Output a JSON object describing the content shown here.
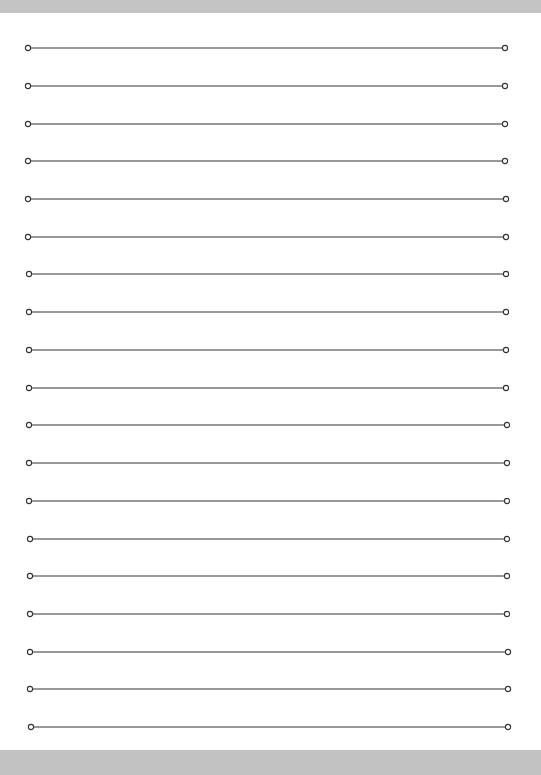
{
  "document": {
    "type": "lined-paper",
    "line_count": 20,
    "line_color": "#333333",
    "background_color": "#ffffff",
    "frame_color": "#c4c4c4",
    "endpoint_marker": "circle-icon",
    "lines": [
      {
        "y": 48,
        "x1": 28,
        "x2": 505
      },
      {
        "y": 86,
        "x1": 28,
        "x2": 505
      },
      {
        "y": 124,
        "x1": 28,
        "x2": 505
      },
      {
        "y": 161,
        "x1": 28,
        "x2": 505
      },
      {
        "y": 199,
        "x1": 28,
        "x2": 506
      },
      {
        "y": 237,
        "x1": 28,
        "x2": 506
      },
      {
        "y": 274,
        "x1": 29,
        "x2": 506
      },
      {
        "y": 312,
        "x1": 29,
        "x2": 506
      },
      {
        "y": 350,
        "x1": 29,
        "x2": 506
      },
      {
        "y": 388,
        "x1": 29,
        "x2": 506
      },
      {
        "y": 425,
        "x1": 29,
        "x2": 507
      },
      {
        "y": 463,
        "x1": 29,
        "x2": 507
      },
      {
        "y": 501,
        "x1": 29,
        "x2": 507
      },
      {
        "y": 539,
        "x1": 30,
        "x2": 507
      },
      {
        "y": 576,
        "x1": 30,
        "x2": 507
      },
      {
        "y": 614,
        "x1": 30,
        "x2": 507
      },
      {
        "y": 652,
        "x1": 30,
        "x2": 508
      },
      {
        "y": 689,
        "x1": 30,
        "x2": 508
      },
      {
        "y": 727,
        "x1": 31,
        "x2": 508
      }
    ]
  }
}
